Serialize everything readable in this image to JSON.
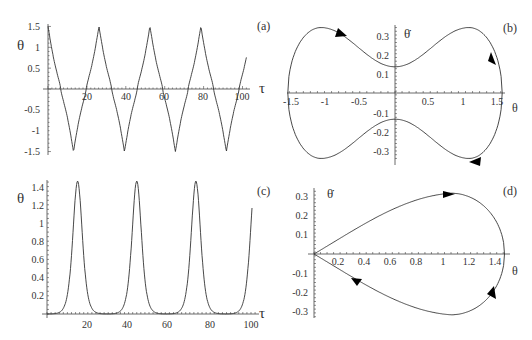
{
  "figure": {
    "panels": [
      {
        "id": "a",
        "label": "(a)",
        "xlabel": "τ",
        "ylabel": "θ",
        "xticks": [
          "20",
          "40",
          "60",
          "80",
          "100"
        ],
        "yticks": [
          "1.5",
          "1",
          "0.5",
          "-0.5",
          "-1",
          "-1.5"
        ]
      },
      {
        "id": "b",
        "label": "(b)",
        "xlabel": "θ",
        "ylabel": "θ̇",
        "xticks": [
          "-1.5",
          "-1",
          "-0.5",
          "0.5",
          "1",
          "1.5"
        ],
        "yticks": [
          "0.3",
          "0.2",
          "0.1",
          "-0.1",
          "-0.2",
          "-0.3"
        ]
      },
      {
        "id": "c",
        "label": "(c)",
        "xlabel": "τ",
        "ylabel": "θ",
        "xticks": [
          "20",
          "40",
          "60",
          "80",
          "100"
        ],
        "yticks": [
          "1.4",
          "1.2",
          "1",
          "0.8",
          "0.6",
          "0.4",
          "0.2"
        ]
      },
      {
        "id": "d",
        "label": "(d)",
        "xlabel": "θ",
        "ylabel": "θ̇",
        "xticks": [
          "0.2",
          "0.4",
          "0.6",
          "0.8",
          "1",
          "1.2",
          "1.4"
        ],
        "yticks": [
          "0.3",
          "0.2",
          "0.1",
          "-0.1",
          "-0.2",
          "-0.3"
        ]
      }
    ]
  },
  "chart_data": [
    {
      "panel": "(a)",
      "type": "line",
      "title": "",
      "xlabel": "τ",
      "ylabel": "θ",
      "xlim": [
        0,
        102
      ],
      "ylim": [
        -1.5,
        1.5
      ],
      "xticks": [
        20,
        40,
        60,
        80,
        100
      ],
      "yticks": [
        -1.5,
        -1,
        -0.5,
        0.5,
        1,
        1.5
      ],
      "grid": false,
      "description": "Periodic oscillation (rotating/libration-like) with sharp cusp-like peaks at ±1.5, period ≈ 26",
      "series": [
        {
          "name": "theta(tau)",
          "x": [
            0,
            7,
            13.5,
            20,
            26.5,
            33,
            39.5,
            46,
            52.5,
            59,
            65.5,
            72,
            78.5,
            85,
            91.5,
            98,
            102
          ],
          "y": [
            1.5,
            0,
            -1.5,
            0,
            1.5,
            0,
            -1.5,
            0,
            1.5,
            0,
            -1.5,
            0,
            1.5,
            0,
            -1.5,
            0,
            0.35
          ]
        }
      ]
    },
    {
      "panel": "(b)",
      "type": "line",
      "title": "",
      "xlabel": "θ",
      "ylabel": "θ̇",
      "xlim": [
        -1.5,
        1.55
      ],
      "ylim": [
        -0.35,
        0.35
      ],
      "xticks": [
        -1.5,
        -1,
        -0.5,
        0.5,
        1,
        1.5
      ],
      "yticks": [
        -0.3,
        -0.2,
        -0.1,
        0.1,
        0.2,
        0.3
      ],
      "grid": false,
      "description": "Closed phase-space orbit (peanut shape), clockwise direction arrows",
      "series": [
        {
          "name": "orbit",
          "x": [
            0,
            0.5,
            1.05,
            1.4,
            1.52,
            1.4,
            1.05,
            0.5,
            0,
            -0.5,
            -1.05,
            -1.4,
            -1.52,
            -1.4,
            -1.05,
            -0.5,
            0
          ],
          "y": [
            0.14,
            0.24,
            0.35,
            0.25,
            0,
            -0.25,
            -0.35,
            -0.24,
            -0.14,
            -0.24,
            -0.35,
            -0.25,
            0,
            0.25,
            0.35,
            0.24,
            0.14
          ]
        }
      ],
      "annotations": [
        "direction arrows at (-0.75,0.3), (1.45,0.2), (1.05,-0.34)"
      ]
    },
    {
      "panel": "(c)",
      "type": "line",
      "title": "",
      "xlabel": "τ",
      "ylabel": "θ",
      "xlim": [
        0,
        102
      ],
      "ylim": [
        0,
        1.5
      ],
      "xticks": [
        20,
        40,
        60,
        80,
        100
      ],
      "yticks": [
        0.2,
        0.4,
        0.6,
        0.8,
        1,
        1.2,
        1.4
      ],
      "grid": false,
      "description": "Periodic pulses (homoclinic-like) peaking at ≈1.46, period ≈ 29",
      "series": [
        {
          "name": "theta(tau)",
          "x": [
            0,
            5,
            10,
            13,
            15,
            17,
            20,
            25,
            30,
            35,
            40,
            42,
            44,
            46,
            49,
            54,
            59,
            64,
            69,
            71,
            73,
            75,
            78,
            83,
            88,
            93,
            98,
            101
          ],
          "y": [
            0.01,
            0.1,
            0.6,
            1.2,
            1.46,
            1.2,
            0.6,
            0.1,
            0.01,
            0.1,
            0.6,
            1.2,
            1.46,
            1.2,
            0.6,
            0.1,
            0.01,
            0.1,
            0.6,
            1.2,
            1.46,
            1.2,
            0.6,
            0.1,
            0.01,
            0.1,
            0.6,
            1.4
          ]
        }
      ]
    },
    {
      "panel": "(d)",
      "type": "line",
      "title": "",
      "xlabel": "θ",
      "ylabel": "θ̇",
      "xlim": [
        0,
        1.5
      ],
      "ylim": [
        -0.33,
        0.33
      ],
      "xticks": [
        0.2,
        0.4,
        0.6,
        0.8,
        1,
        1.2,
        1.4
      ],
      "yticks": [
        -0.3,
        -0.2,
        -0.1,
        0.1,
        0.2,
        0.3
      ],
      "grid": false,
      "description": "Teardrop-shaped closed orbit from origin to θ≈1.46, clockwise arrows",
      "series": [
        {
          "name": "orbit",
          "x": [
            0,
            0.3,
            0.6,
            0.9,
            1.05,
            1.3,
            1.46,
            1.3,
            1.05,
            0.9,
            0.6,
            0.3,
            0
          ],
          "y": [
            0,
            0.13,
            0.24,
            0.31,
            0.32,
            0.24,
            0,
            -0.24,
            -0.32,
            -0.31,
            -0.24,
            -0.13,
            0
          ]
        }
      ],
      "annotations": [
        "direction arrows at (1.05,0.32), (1.4,-0.2), (0.33,-0.13)"
      ]
    }
  ]
}
